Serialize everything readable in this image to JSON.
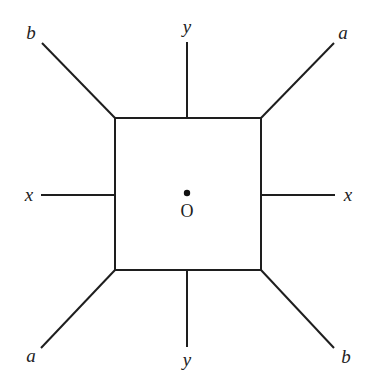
{
  "diagram": {
    "type": "square-with-radiating-lines",
    "square": {
      "x1": 115,
      "y1": 118,
      "x2": 261,
      "y2": 270
    },
    "center": {
      "x": 187,
      "y": 193,
      "label": "O"
    },
    "lines": [
      {
        "id": "top-left",
        "label": "b",
        "from": [
          115,
          118
        ],
        "to": [
          42,
          43
        ]
      },
      {
        "id": "top",
        "label": "y",
        "from": [
          187,
          118
        ],
        "to": [
          187,
          42
        ]
      },
      {
        "id": "top-right",
        "label": "a",
        "from": [
          261,
          118
        ],
        "to": [
          334,
          43
        ]
      },
      {
        "id": "left",
        "label": "x",
        "from": [
          115,
          195
        ],
        "to": [
          41,
          195
        ]
      },
      {
        "id": "right",
        "label": "x",
        "from": [
          261,
          195
        ],
        "to": [
          335,
          195
        ]
      },
      {
        "id": "bottom-left",
        "label": "a",
        "from": [
          115,
          270
        ],
        "to": [
          41,
          348
        ]
      },
      {
        "id": "bottom",
        "label": "y",
        "from": [
          187,
          270
        ],
        "to": [
          187,
          347
        ]
      },
      {
        "id": "bottom-right",
        "label": "b",
        "from": [
          261,
          270
        ],
        "to": [
          334,
          348
        ]
      }
    ],
    "labels": {
      "top_left": "b",
      "top": "y",
      "top_right": "a",
      "left": "x",
      "right": "x",
      "bottom_left": "a",
      "bottom": "y",
      "bottom_right": "b",
      "center": "O"
    },
    "colors": {
      "stroke": "#1e1e1e",
      "text": "#222222",
      "background": "#ffffff"
    }
  }
}
